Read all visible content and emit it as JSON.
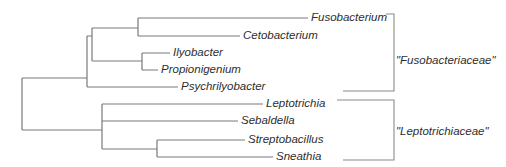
{
  "tree": {
    "type": "phylogenetic-cladogram",
    "taxa": [
      {
        "label": "Fusobacterium"
      },
      {
        "label": "Cetobacterium"
      },
      {
        "label": "Ilyobacter"
      },
      {
        "label": "Propionigenium"
      },
      {
        "label": "Psychrilyobacter"
      },
      {
        "label": "Leptotrichia"
      },
      {
        "label": "Sebaldella"
      },
      {
        "label": "Streptobacillus"
      },
      {
        "label": "Sneathia"
      }
    ],
    "groups": [
      {
        "label": "\"Fusobacteriaceae\"",
        "members": [
          "Fusobacterium",
          "Cetobacterium",
          "Ilyobacter",
          "Propionigenium",
          "Psychrilyobacter"
        ]
      },
      {
        "label": "\"Leptotrichiaceae\"",
        "members": [
          "Leptotrichia",
          "Sebaldella",
          "Streptobacillus",
          "Sneathia"
        ]
      }
    ],
    "newick": "(((((Fusobacterium,Cetobacterium),(Ilyobacter,Propionigenium)),Psychrilyobacter)),(Leptotrichia,Sebaldella,(Streptobacillus,Sneathia)));",
    "colors": {
      "branch": "#7a7a7a",
      "text": "#2e2e2e"
    }
  }
}
